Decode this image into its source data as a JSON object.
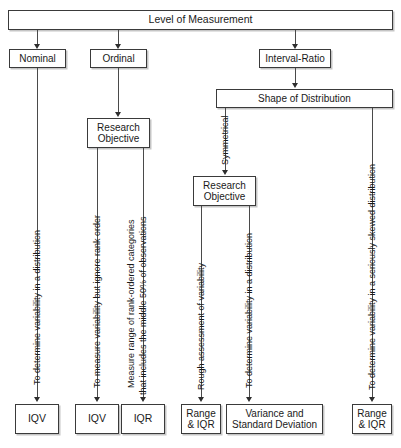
{
  "diagram": {
    "title": "Level of Measurement",
    "type": "flowchart",
    "root": {
      "label": "Level of Measurement"
    },
    "levels": [
      {
        "label": "Nominal"
      },
      {
        "label": "Ordinal"
      },
      {
        "label": "Interval-Ratio"
      }
    ],
    "nodes": {
      "shape_of_distribution": "Shape of Distribution",
      "research_objective_ordinal": "Research\nObjective",
      "research_objective_interval": "Research\nObjective"
    },
    "branch_labels": {
      "symmetrical": "Symmetrical"
    },
    "edge_labels": {
      "nominal_to_iqv": "To determine variability in a distribution",
      "ordinal_to_iqv": "To measure variability but ignore rank order",
      "ordinal_to_iqr_line1": "Measure range of rank-ordered categories",
      "ordinal_to_iqr_line2": "that includes the middle 50% of observations",
      "interval_to_range_iqr": "Rough assessment of variability",
      "interval_to_variance": "To determine variability in a distribution",
      "skewed_to_range_iqr": "To determine variability in a seriously skewed distribution"
    },
    "outcomes": [
      {
        "label": "IQV"
      },
      {
        "label": "IQV"
      },
      {
        "label": "IQR"
      },
      {
        "label": "Range\n& IQR"
      },
      {
        "label": "Variance and\nStandard Deviation"
      },
      {
        "label": "Range\n& IQR"
      }
    ],
    "colors": {
      "background": "#ffffff",
      "box_border": "#3a3a3a",
      "line": "#4a4a4a",
      "text": "#1a1a1a",
      "shadow": "#969696"
    }
  }
}
